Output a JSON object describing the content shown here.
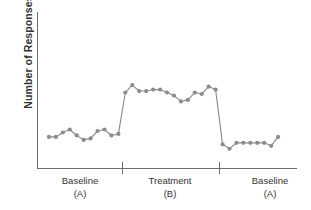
{
  "chart_data": {
    "type": "line",
    "title": "",
    "xlabel": "",
    "ylabel": "Number of Responses",
    "grid": false,
    "legend": false,
    "xtick_labels": [],
    "ytick_labels": [],
    "axis_ranges": {
      "x": [
        0,
        36
      ],
      "y": [
        0,
        100
      ]
    },
    "series_color": "#8c8c8c",
    "marker": "circle",
    "phases": [
      {
        "id": "A1",
        "name": "Baseline",
        "code": "(A)",
        "start_x": 1,
        "end_x": 11
      },
      {
        "id": "B",
        "name": "Treatment",
        "code": "(B)",
        "start_x": 12,
        "end_x": 25
      },
      {
        "id": "A2",
        "name": "Baseline",
        "code": "(A)",
        "start_x": 26,
        "end_x": 34
      }
    ],
    "phase_divider_x": [
      11.5,
      25.5
    ],
    "series": [
      {
        "name": "Responses",
        "x": [
          1,
          2,
          3,
          4,
          5,
          6,
          7,
          8,
          9,
          10,
          11,
          12,
          13,
          14,
          15,
          16,
          17,
          18,
          19,
          20,
          21,
          22,
          23,
          24,
          25,
          26,
          27,
          28,
          29,
          30,
          31,
          32,
          33,
          34
        ],
        "values": [
          21,
          21,
          24,
          26,
          22,
          19,
          20,
          25,
          26,
          22,
          23,
          51,
          56,
          52,
          52,
          53,
          53,
          51,
          49,
          45,
          46,
          51,
          50,
          55,
          53,
          16,
          13,
          17,
          17,
          17,
          17,
          17,
          15,
          21
        ]
      }
    ]
  },
  "axis_labels": {
    "y_title": "Number of Responses"
  }
}
